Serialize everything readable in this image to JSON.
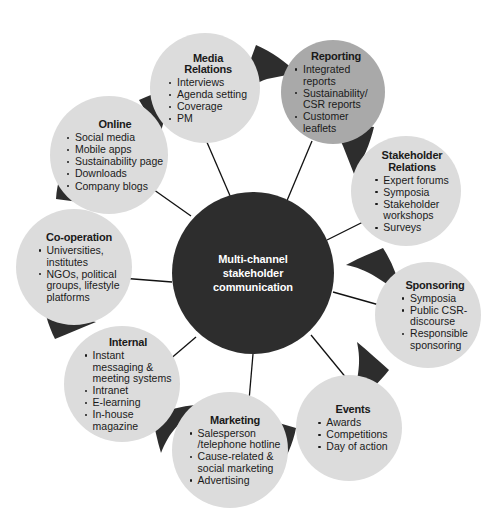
{
  "diagram": {
    "center": {
      "label": "Multi-channel\nstakeholder\ncommunication",
      "color": "#2d2d2d",
      "text_color": "#ffffff"
    },
    "colors": {
      "node_light": "#dcdcdc",
      "node_highlight": "#a9a9a9",
      "wedge": "#2d2d2d",
      "spoke": "#111111",
      "text": "#1a1a1a",
      "background": "#ffffff"
    },
    "nodes": [
      {
        "id": "media-relations",
        "title": "Media\nRelations",
        "items": [
          "Interviews",
          "Agenda setting",
          "Coverage",
          "PM"
        ],
        "highlight": false
      },
      {
        "id": "reporting",
        "title": "Reporting",
        "items": [
          "Integrated\nreports",
          "Sustainability/\nCSR reports",
          "Customer leaflets"
        ],
        "highlight": true
      },
      {
        "id": "stakeholder-relations",
        "title": "Stakeholder\nRelations",
        "items": [
          "Expert forums",
          "Symposia",
          "Stakeholder\nworkshops",
          "Surveys"
        ],
        "highlight": false
      },
      {
        "id": "sponsoring",
        "title": "Sponsoring",
        "items": [
          "Symposia",
          "Public CSR-\ndiscourse",
          "Responsible\nsponsoring"
        ],
        "highlight": false
      },
      {
        "id": "events",
        "title": "Events",
        "items": [
          "Awards",
          "Competitions",
          "Day of action"
        ],
        "highlight": false
      },
      {
        "id": "marketing",
        "title": "Marketing",
        "items": [
          "Salesperson\n/telephone hotline",
          "Cause-related &\nsocial marketing",
          "Advertising"
        ],
        "highlight": false
      },
      {
        "id": "internal",
        "title": "Internal",
        "items": [
          "Instant\nmessaging &\nmeeting systems",
          "Intranet",
          "E-learning",
          "In-house\nmagazine"
        ],
        "highlight": false
      },
      {
        "id": "co-operation",
        "title": "Co-operation",
        "items": [
          "Universities,\ninstitutes",
          "NGOs, political\ngroups, lifestyle\nplatforms"
        ],
        "highlight": false
      },
      {
        "id": "online",
        "title": "Online",
        "items": [
          "Social media",
          "Mobile apps",
          "Sustainability page",
          "Downloads",
          "Company blogs"
        ],
        "highlight": false
      }
    ]
  }
}
